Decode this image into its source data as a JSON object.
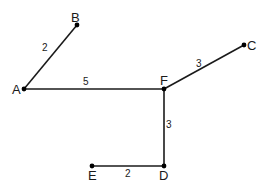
{
  "diagram": {
    "type": "weighted-graph",
    "nodes": [
      {
        "id": "A",
        "label": "A",
        "x": 24,
        "y": 89
      },
      {
        "id": "B",
        "label": "B",
        "x": 77,
        "y": 25
      },
      {
        "id": "C",
        "label": "C",
        "x": 244,
        "y": 45
      },
      {
        "id": "D",
        "label": "D",
        "x": 164,
        "y": 166
      },
      {
        "id": "E",
        "label": "E",
        "x": 92,
        "y": 166
      },
      {
        "id": "F",
        "label": "F",
        "x": 164,
        "y": 89
      }
    ],
    "edges": [
      {
        "from": "A",
        "to": "B",
        "weight": "2"
      },
      {
        "from": "A",
        "to": "F",
        "weight": "5"
      },
      {
        "from": "F",
        "to": "C",
        "weight": "3"
      },
      {
        "from": "F",
        "to": "D",
        "weight": "3"
      },
      {
        "from": "E",
        "to": "D",
        "weight": "2"
      }
    ]
  }
}
